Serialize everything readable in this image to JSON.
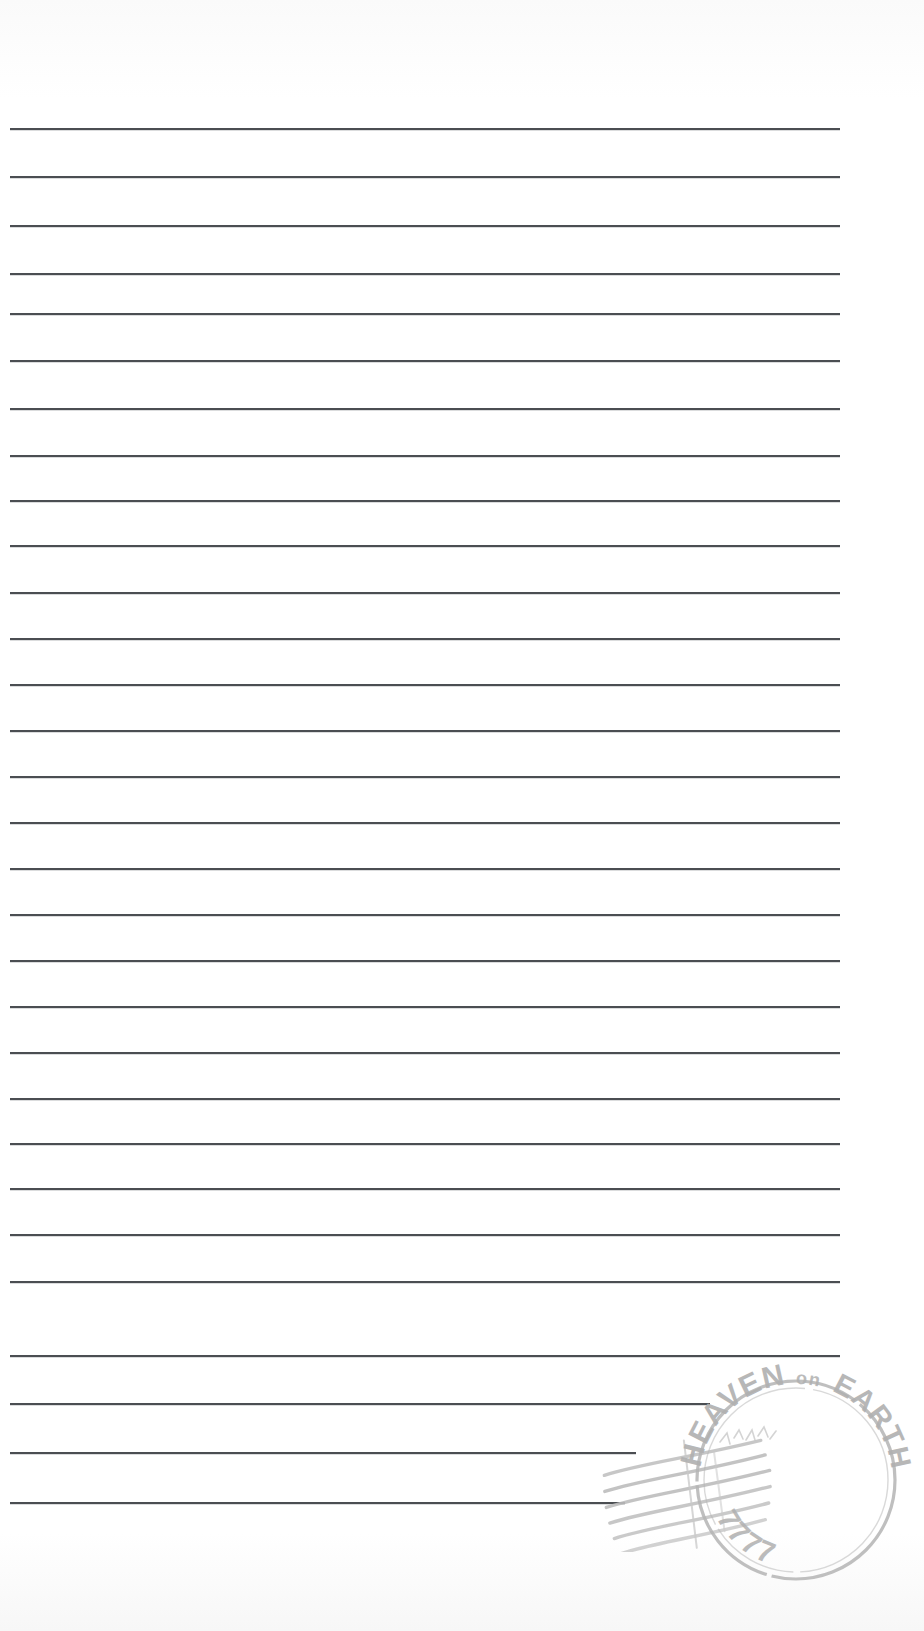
{
  "page": {
    "kind": "lined-notepaper",
    "width": 924,
    "height": 1631,
    "background_color": "#fdfdfd",
    "rule_color": "#3c3f44"
  },
  "ruled_lines": {
    "count": 29,
    "first_y": 128,
    "spacing": 49,
    "left_x": 10,
    "default_right_x": 840,
    "lines": [
      {
        "y": 128,
        "x1": 10,
        "x2": 840
      },
      {
        "y": 176,
        "x1": 10,
        "x2": 840
      },
      {
        "y": 225,
        "x1": 10,
        "x2": 840
      },
      {
        "y": 273,
        "x1": 10,
        "x2": 840
      },
      {
        "y": 313,
        "x1": 10,
        "x2": 840
      },
      {
        "y": 360,
        "x1": 10,
        "x2": 840
      },
      {
        "y": 408,
        "x1": 10,
        "x2": 840
      },
      {
        "y": 455,
        "x1": 10,
        "x2": 840
      },
      {
        "y": 500,
        "x1": 10,
        "x2": 840
      },
      {
        "y": 545,
        "x1": 10,
        "x2": 840
      },
      {
        "y": 592,
        "x1": 10,
        "x2": 840
      },
      {
        "y": 638,
        "x1": 10,
        "x2": 840
      },
      {
        "y": 684,
        "x1": 10,
        "x2": 840
      },
      {
        "y": 730,
        "x1": 10,
        "x2": 840
      },
      {
        "y": 776,
        "x1": 10,
        "x2": 840
      },
      {
        "y": 822,
        "x1": 10,
        "x2": 840
      },
      {
        "y": 868,
        "x1": 10,
        "x2": 840
      },
      {
        "y": 914,
        "x1": 10,
        "x2": 840
      },
      {
        "y": 960,
        "x1": 10,
        "x2": 840
      },
      {
        "y": 1006,
        "x1": 10,
        "x2": 840
      },
      {
        "y": 1052,
        "x1": 10,
        "x2": 840
      },
      {
        "y": 1098,
        "x1": 10,
        "x2": 840
      },
      {
        "y": 1143,
        "x1": 10,
        "x2": 840
      },
      {
        "y": 1188,
        "x1": 10,
        "x2": 840
      },
      {
        "y": 1234,
        "x1": 10,
        "x2": 840
      },
      {
        "y": 1281,
        "x1": 10,
        "x2": 840
      },
      {
        "y": 1355,
        "x1": 10,
        "x2": 840
      },
      {
        "y": 1403,
        "x1": 10,
        "x2": 710
      },
      {
        "y": 1452,
        "x1": 10,
        "x2": 636
      },
      {
        "y": 1502,
        "x1": 10,
        "x2": 625
      }
    ]
  },
  "postmark": {
    "name": "postmark-stamp",
    "shape": "circle",
    "ink_color": "#b4b4b4",
    "center_x": 796,
    "center_y": 1480,
    "radius": 104,
    "text_top": "HEAVEN",
    "text_top_small": "on",
    "text_right": "EARTH",
    "text_bottom": "7777",
    "inner_mark": "illegible faded date scribble"
  },
  "cancellation": {
    "name": "cancellation-waves",
    "wave_count": 6,
    "ink_color": "#bdbdbd",
    "angle_degrees": -9
  }
}
